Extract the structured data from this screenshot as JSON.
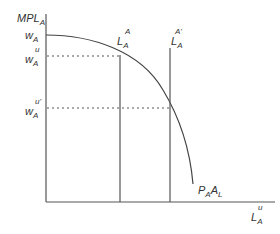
{
  "diagram": {
    "y_axis_label": {
      "main": "MPL",
      "sub": "A"
    },
    "x_axis_label": {
      "main": "L",
      "sub": "A",
      "sup": "u"
    },
    "curve_label": {
      "p": "P",
      "p_sub": "A",
      "a": "A",
      "a_sub": "L"
    },
    "w_a": {
      "main": "w",
      "sub": "A"
    },
    "w_a_u": {
      "main": "w",
      "sub": "A",
      "sup": "u"
    },
    "w_a_u_prime": {
      "main": "w",
      "sub": "A",
      "sup": "u'"
    },
    "l_a_a": {
      "main": "L",
      "sub": "A",
      "sup": "A"
    },
    "l_a_a_prime": {
      "main": "L",
      "sub": "A",
      "sup": "A'"
    }
  }
}
